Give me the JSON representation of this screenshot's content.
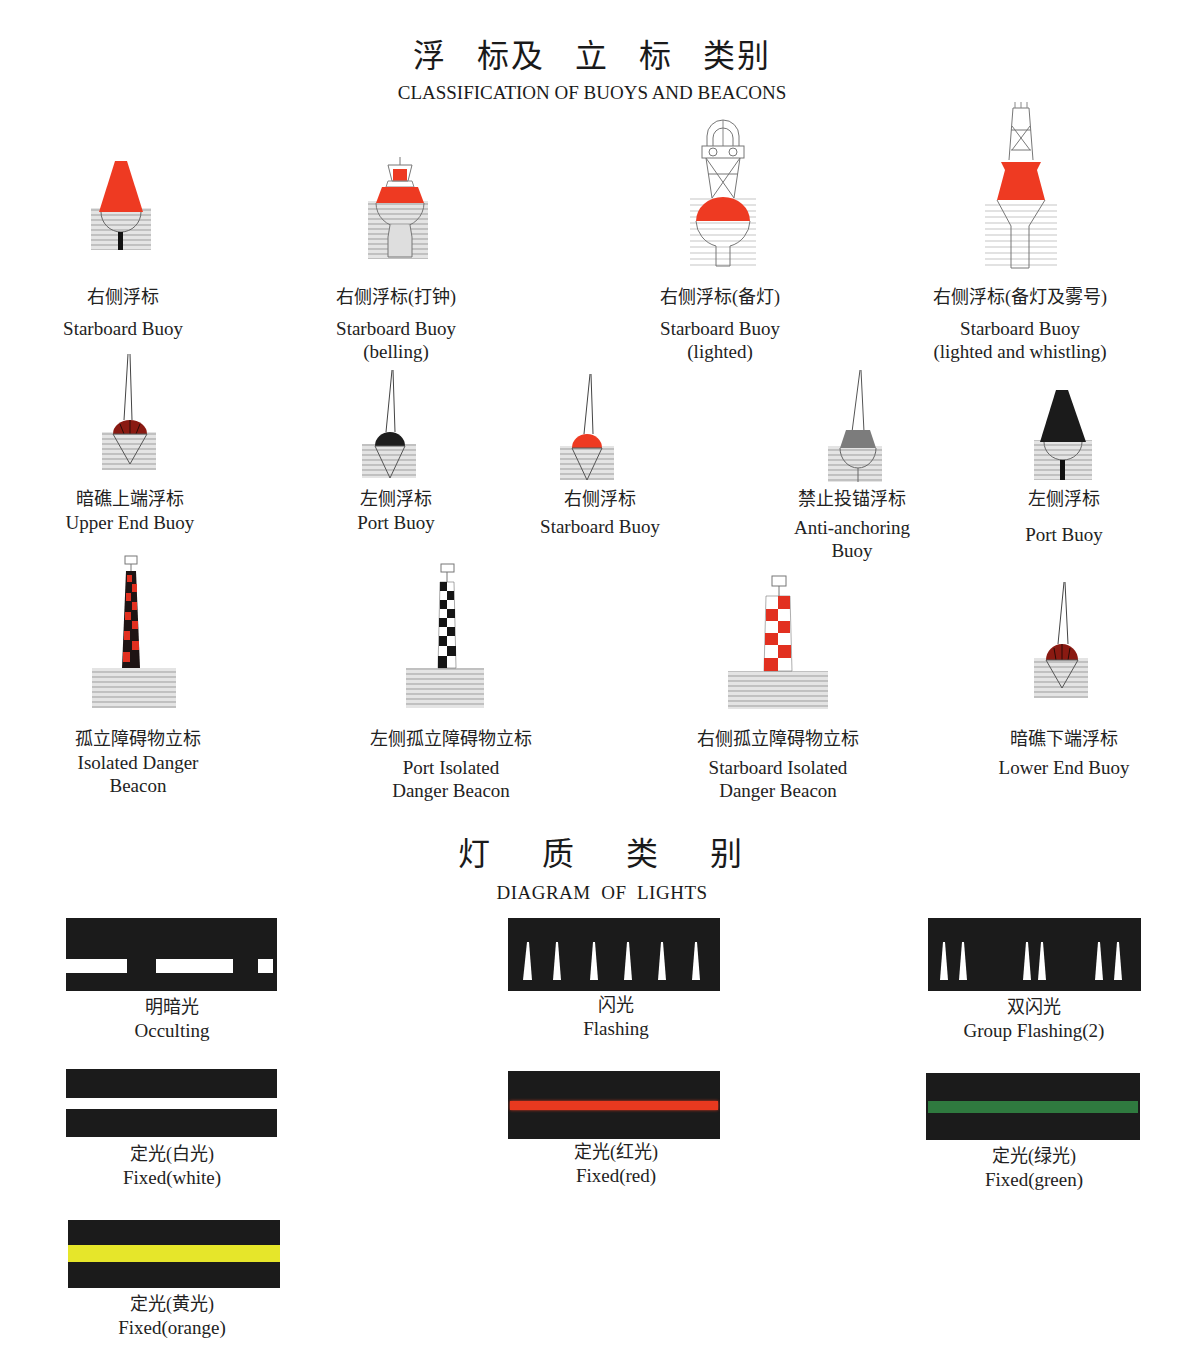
{
  "header": {
    "title_cn_chars": [
      "浮",
      "标及",
      "立",
      "标",
      "类别"
    ],
    "title_en": "CLASSIFICATION OF BUOYS AND BEACONS"
  },
  "buoys": [
    {
      "cn": "右侧浮标",
      "en1": "Starboard Buoy",
      "en2": "",
      "icon": "starboard-buoy-conical-icon"
    },
    {
      "cn": "右侧浮标(打钟)",
      "en1": "Starboard Buoy",
      "en2": "(belling)",
      "icon": "starboard-bell-buoy-icon"
    },
    {
      "cn": "右侧浮标(备灯)",
      "en1": "Starboard Buoy",
      "en2": "(lighted)",
      "icon": "starboard-lighted-buoy-icon"
    },
    {
      "cn": "右侧浮标(备灯及雾号)",
      "en1": "Starboard Buoy",
      "en2": "(lighted and whistling)",
      "icon": "starboard-whistle-buoy-icon"
    },
    {
      "cn": "暗礁上端浮标",
      "en1": "Upper End Buoy",
      "en2": "",
      "icon": "upper-end-buoy-icon"
    },
    {
      "cn": "左侧浮标",
      "en1": "Port Buoy",
      "en2": "",
      "icon": "port-spar-buoy-icon"
    },
    {
      "cn": "右侧浮标",
      "en1": "Starboard Buoy",
      "en2": "",
      "icon": "starboard-spar-buoy-icon"
    },
    {
      "cn": "禁止投锚浮标",
      "en1": "Anti-anchoring",
      "en2": "Buoy",
      "icon": "anti-anchoring-buoy-icon"
    },
    {
      "cn": "左侧浮标",
      "en1": "Port Buoy",
      "en2": "",
      "icon": "port-conical-buoy-icon"
    },
    {
      "cn": "孤立障碍物立标",
      "en1": "Isolated Danger",
      "en2": "Beacon",
      "icon": "isolated-danger-beacon-icon"
    },
    {
      "cn": "左侧孤立障碍物立标",
      "en1": "Port Isolated",
      "en2": "Danger Beacon",
      "icon": "port-isolated-danger-beacon-icon"
    },
    {
      "cn": "右侧孤立障碍物立标",
      "en1": "Starboard Isolated",
      "en2": "Danger Beacon",
      "icon": "starboard-isolated-danger-beacon-icon"
    },
    {
      "cn": "暗礁下端浮标",
      "en1": "Lower End Buoy",
      "en2": "",
      "icon": "lower-end-buoy-icon"
    }
  ],
  "lights_header": {
    "title_cn_chars": [
      "灯",
      "质",
      "类",
      "别"
    ],
    "title_en": "DIAGRAM  OF  LIGHTS"
  },
  "lights": [
    {
      "cn": "明暗光",
      "en": "Occulting",
      "type": "occulting",
      "color": "#ffffff"
    },
    {
      "cn": "闪光",
      "en": "Flashing",
      "type": "flashing",
      "color": "#ffffff"
    },
    {
      "cn": "双闪光",
      "en": "Group Flashing(2)",
      "type": "group-flashing",
      "color": "#ffffff"
    },
    {
      "cn": "定光(白光)",
      "en": "Fixed(white)",
      "type": "fixed",
      "color": "#ffffff"
    },
    {
      "cn": "定光(红光)",
      "en": "Fixed(red)",
      "type": "fixed",
      "color": "#e8391f"
    },
    {
      "cn": "定光(绿光)",
      "en": "Fixed(green)",
      "type": "fixed",
      "color": "#2f7a3f"
    },
    {
      "cn": "定光(黄光)",
      "en": "Fixed(orange)",
      "type": "fixed",
      "color": "#e6e62a"
    }
  ],
  "colors": {
    "red": "#ee3a22",
    "black": "#1b1b1b",
    "water": "#d7d7d7",
    "grey": "#7a7a7a"
  }
}
